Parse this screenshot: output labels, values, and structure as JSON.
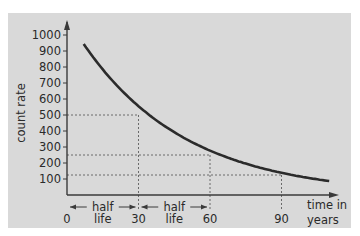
{
  "chart_data": {
    "type": "line",
    "title": "",
    "xlabel": "time in years",
    "xlabel_lines": [
      "time in",
      "years"
    ],
    "ylabel": "count rate",
    "x_ticks": [
      0,
      30,
      60,
      90
    ],
    "x_tick_labels": [
      "0",
      "30",
      "60",
      "90"
    ],
    "y_ticks": [
      100,
      200,
      300,
      400,
      500,
      600,
      700,
      800,
      900,
      1000
    ],
    "y_tick_labels": [
      "100",
      "200",
      "300",
      "400",
      "500",
      "600",
      "700",
      "800",
      "900",
      "1000"
    ],
    "xlim": [
      0,
      110
    ],
    "ylim": [
      0,
      1000
    ],
    "grid": false,
    "series": [
      {
        "name": "decay curve",
        "half_life": 30,
        "initial_value": 1000,
        "x": [
          7,
          10,
          20,
          30,
          40,
          50,
          60,
          70,
          80,
          90,
          100,
          110
        ],
        "values": [
          851,
          794,
          630,
          500,
          397,
          315,
          250,
          198,
          157,
          125,
          99,
          79
        ]
      }
    ],
    "guide_lines": [
      {
        "x": 30,
        "y": 500
      },
      {
        "x": 60,
        "y": 250
      },
      {
        "x": 90,
        "y": 125
      }
    ],
    "annotations": [
      {
        "text_lines": [
          "half",
          "life"
        ],
        "from_x": 0,
        "to_x": 30
      },
      {
        "text_lines": [
          "half",
          "life"
        ],
        "from_x": 30,
        "to_x": 60
      }
    ]
  },
  "colors": {
    "background": "#d9d9d9",
    "curve": "#2b2b2b",
    "axis": "#3a3a3a",
    "guide": "#6a6a6a"
  }
}
